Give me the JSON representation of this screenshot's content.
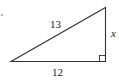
{
  "diagram": {
    "type": "right-triangle",
    "hypotenuse_label": "13",
    "base_label": "12",
    "height_label": "x",
    "right_angle_marker": true,
    "stroke_color": "#333333"
  }
}
